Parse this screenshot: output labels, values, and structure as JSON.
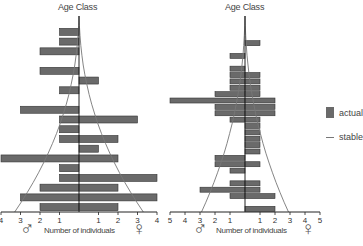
{
  "chart_data": [
    {
      "type": "bar",
      "subtype": "population-pyramid",
      "title": "Age Class",
      "xlabel": "Number of individuals",
      "ylabel": "Age Class",
      "left_label": "♂",
      "right_label": "♀",
      "xlim": [
        -4,
        4
      ],
      "x_ticks_left": [
        "4",
        "3",
        "2",
        "1"
      ],
      "x_ticks_right": [
        "1",
        "2",
        "3",
        "4"
      ],
      "note": "Rows listed top (oldest) to bottom (youngest); male values extend left, female values right",
      "series": [
        {
          "name": "actual male",
          "values": [
            1,
            1,
            2,
            0,
            2,
            0,
            1,
            0,
            3,
            1,
            1,
            1,
            0,
            4,
            1,
            1,
            2,
            3,
            2
          ]
        },
        {
          "name": "actual female",
          "values": [
            0,
            0,
            0,
            0,
            0,
            1,
            0,
            0,
            0,
            3,
            0,
            2,
            1,
            2,
            0,
            4,
            2,
            4,
            2
          ]
        }
      ],
      "stable_curve": "thin line envelope widening from ~0 at top to ~3 at base on both sides"
    },
    {
      "type": "bar",
      "subtype": "population-pyramid",
      "title": "Age Class",
      "xlabel": "Number of individuals",
      "ylabel": "Age Class",
      "left_label": "♂",
      "right_label": "♀",
      "xlim": [
        -5,
        5
      ],
      "x_ticks_left": [
        "5",
        "4",
        "3",
        "2",
        "1"
      ],
      "x_ticks_right": [
        "1",
        "2",
        "3",
        "4",
        "5"
      ],
      "note": "Many narrow age classes; male values extend left, female values right",
      "series": [
        {
          "name": "actual male",
          "values": [
            0,
            0,
            1,
            0,
            1,
            1,
            1,
            1,
            2,
            5,
            2,
            2,
            1,
            0,
            0,
            0,
            0,
            0,
            2,
            2,
            1,
            0,
            1,
            3,
            1,
            0,
            0
          ]
        },
        {
          "name": "actual female",
          "values": [
            1,
            0,
            0,
            0,
            0,
            1,
            1,
            1,
            1,
            2,
            2,
            2,
            1,
            1,
            1,
            1,
            1,
            1,
            0,
            1,
            0,
            0,
            1,
            1,
            2,
            0,
            2
          ]
        }
      ],
      "stable_curve": "thin line envelope widening from ~0 at top to ~2.5 at base on both sides"
    }
  ],
  "legend": {
    "items": [
      {
        "label": "actual",
        "kind": "swatch",
        "color": "#6a6a6a"
      },
      {
        "label": "stable",
        "kind": "line",
        "color": "#777777"
      }
    ]
  },
  "charts_text": {
    "left": {
      "title": "Age Class",
      "xlabel": "Number of individuals",
      "male": "♂",
      "female": "♀"
    },
    "right": {
      "title": "Age Class",
      "xlabel": "Number of individuals",
      "male": "♂",
      "female": "♀"
    }
  },
  "colors": {
    "bar": "#6a6a6a",
    "bar_edge": "#333333",
    "axis": "#222222",
    "stable": "#777777"
  }
}
